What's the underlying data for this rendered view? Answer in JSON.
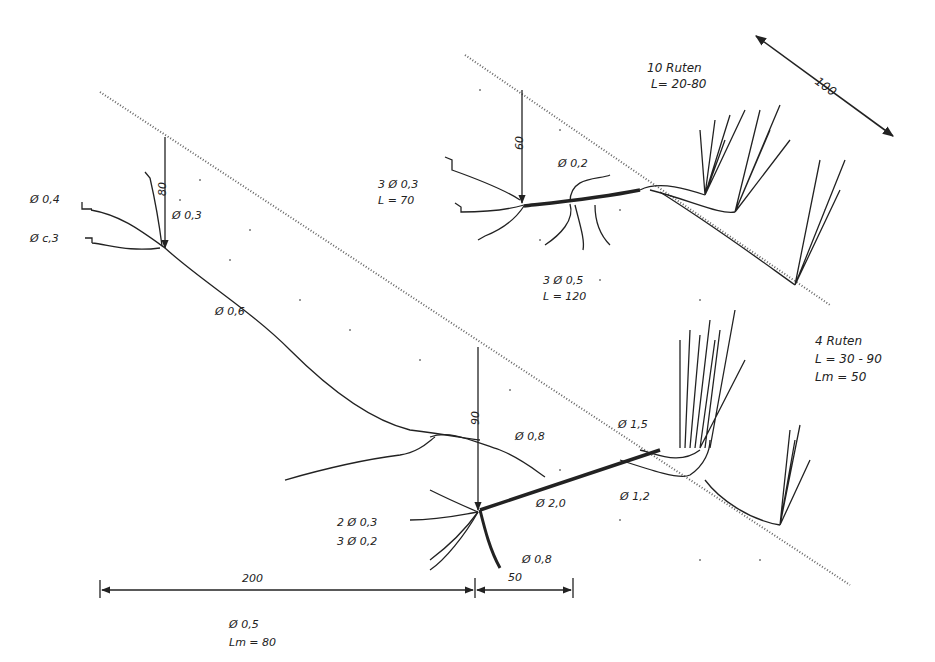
{
  "diagram": {
    "type": "hand-drawn root and shoot system sketch (willow cuttings on slope)",
    "colors": {
      "ink": "#222222",
      "background": "#ffffff",
      "slope_dots": "#555555"
    },
    "upper_plant": {
      "shoots_label": "10 Ruten",
      "shoots_length": "L= 20-80",
      "depth_dim": "60",
      "branch_diameter": "Ø 0,2",
      "root_group": "3 Ø 0,3",
      "root_group_length": "L = 70",
      "main_stem": "3 Ø 0,5",
      "main_stem_length": "L = 120"
    },
    "scale_dim": "100",
    "left_plant": {
      "depth_dim": "80",
      "root_a": "Ø 0,4",
      "root_b": "Ø c,3",
      "root_c": "Ø 0,3",
      "main_root": "Ø 0,6"
    },
    "lower_plant": {
      "shoots_label": "4 Ruten",
      "shoots_length": "L = 30 - 90",
      "shoots_mean": "Lm = 50",
      "depth_dim": "90",
      "branch_upper": "Ø 0,8",
      "stem_upper": "Ø 1,5",
      "stem_main": "Ø 2,0",
      "stem_lower": "Ø 1,2",
      "roots_a": "2 Ø 0,3",
      "roots_b": "3 Ø 0,2",
      "tap_root": "Ø 0,8"
    },
    "bottom_dims": {
      "left": "200",
      "right": "50",
      "note_diameter": "Ø 0,5",
      "note_length": "Lm = 80"
    }
  }
}
